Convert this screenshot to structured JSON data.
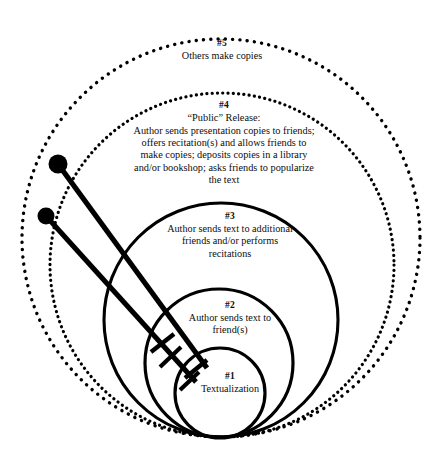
{
  "diagram": {
    "type": "concentric-circles",
    "background_color": "#ffffff",
    "stroke_color": "#000000",
    "rings": [
      {
        "number": "#5",
        "text": "Others make copies",
        "style": "dotted",
        "center_x": 221,
        "center_y": 238,
        "radius": 199
      },
      {
        "number": "#4",
        "text": "“Public” Release:\nAuthor sends presentation copies to friends;\noffers recitation(s) and allows friends to\nmake copies; deposits copies in a library\nand/or bookshop; asks friends to popularize\nthe text",
        "style": "dotted",
        "center_x": 222,
        "center_y": 265,
        "radius": 172
      },
      {
        "number": "#3",
        "text": "Author sends text to additional\nfriends and/or performs\nrecitations",
        "style": "solid",
        "center_x": 221,
        "center_y": 320,
        "radius": 117
      },
      {
        "number": "#2",
        "text": "Author sends text to\nfriend(s)",
        "style": "solid",
        "center_x": 219,
        "center_y": 363,
        "radius": 74
      },
      {
        "number": "#1",
        "text": "Textualization",
        "style": "solid",
        "center_x": 220,
        "center_y": 393,
        "radius": 45
      }
    ],
    "pointers": [
      {
        "name": "pointer-upper",
        "head_x": 58,
        "head_y": 164,
        "head_radius": 9.5,
        "tip_x": 207,
        "tip_y": 368
      },
      {
        "name": "pointer-lower",
        "head_x": 46,
        "head_y": 216,
        "head_radius": 8.5,
        "tip_x": 196,
        "tip_y": 382
      }
    ]
  }
}
